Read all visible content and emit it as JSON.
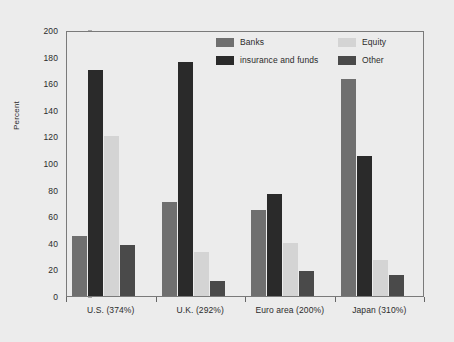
{
  "chart_data": {
    "type": "bar",
    "title": "",
    "subtitle": "",
    "xlabel": "",
    "ylabel": "Percent",
    "ylim": [
      0,
      200
    ],
    "yticks": [
      0,
      20,
      40,
      60,
      80,
      100,
      120,
      140,
      160,
      180,
      200
    ],
    "grid": false,
    "legend_position": "top-right",
    "categories": [
      "U.S. (374%)",
      "U.K. (292%)",
      "Euro area (200%)",
      "Japan (310%)"
    ],
    "series": [
      {
        "name": "Banks",
        "color": "#6f6f6f",
        "values": [
          45,
          71,
          65,
          163
        ]
      },
      {
        "name": "insurance and funds",
        "color": "#2a2a2a",
        "values": [
          170,
          176,
          77,
          105
        ]
      },
      {
        "name": "Equity",
        "color": "#d4d4d4",
        "values": [
          120,
          33,
          40,
          27
        ]
      },
      {
        "name": "Other",
        "color": "#4a4a4a",
        "values": [
          38,
          11,
          19,
          16
        ]
      }
    ]
  },
  "axis": {
    "y_label": "Percent",
    "y_tick_labels": [
      "200",
      "180",
      "160",
      "140",
      "120",
      "100",
      "80",
      "60",
      "40",
      "20",
      "0"
    ],
    "x_tick_labels": [
      "U.S. (374%)",
      "U.K. (292%)",
      "Euro area (200%)",
      "Japan (310%)"
    ]
  },
  "legend": {
    "items": [
      {
        "label": "Banks",
        "color": "#6f6f6f"
      },
      {
        "label": "Equity",
        "color": "#d4d4d4"
      },
      {
        "label": "insurance and funds",
        "color": "#2a2a2a"
      },
      {
        "label": "Other",
        "color": "#4a4a4a"
      }
    ]
  },
  "colors": {
    "background": "#ececec",
    "frame": "#7a7a7a",
    "text": "#2b2b2b"
  }
}
